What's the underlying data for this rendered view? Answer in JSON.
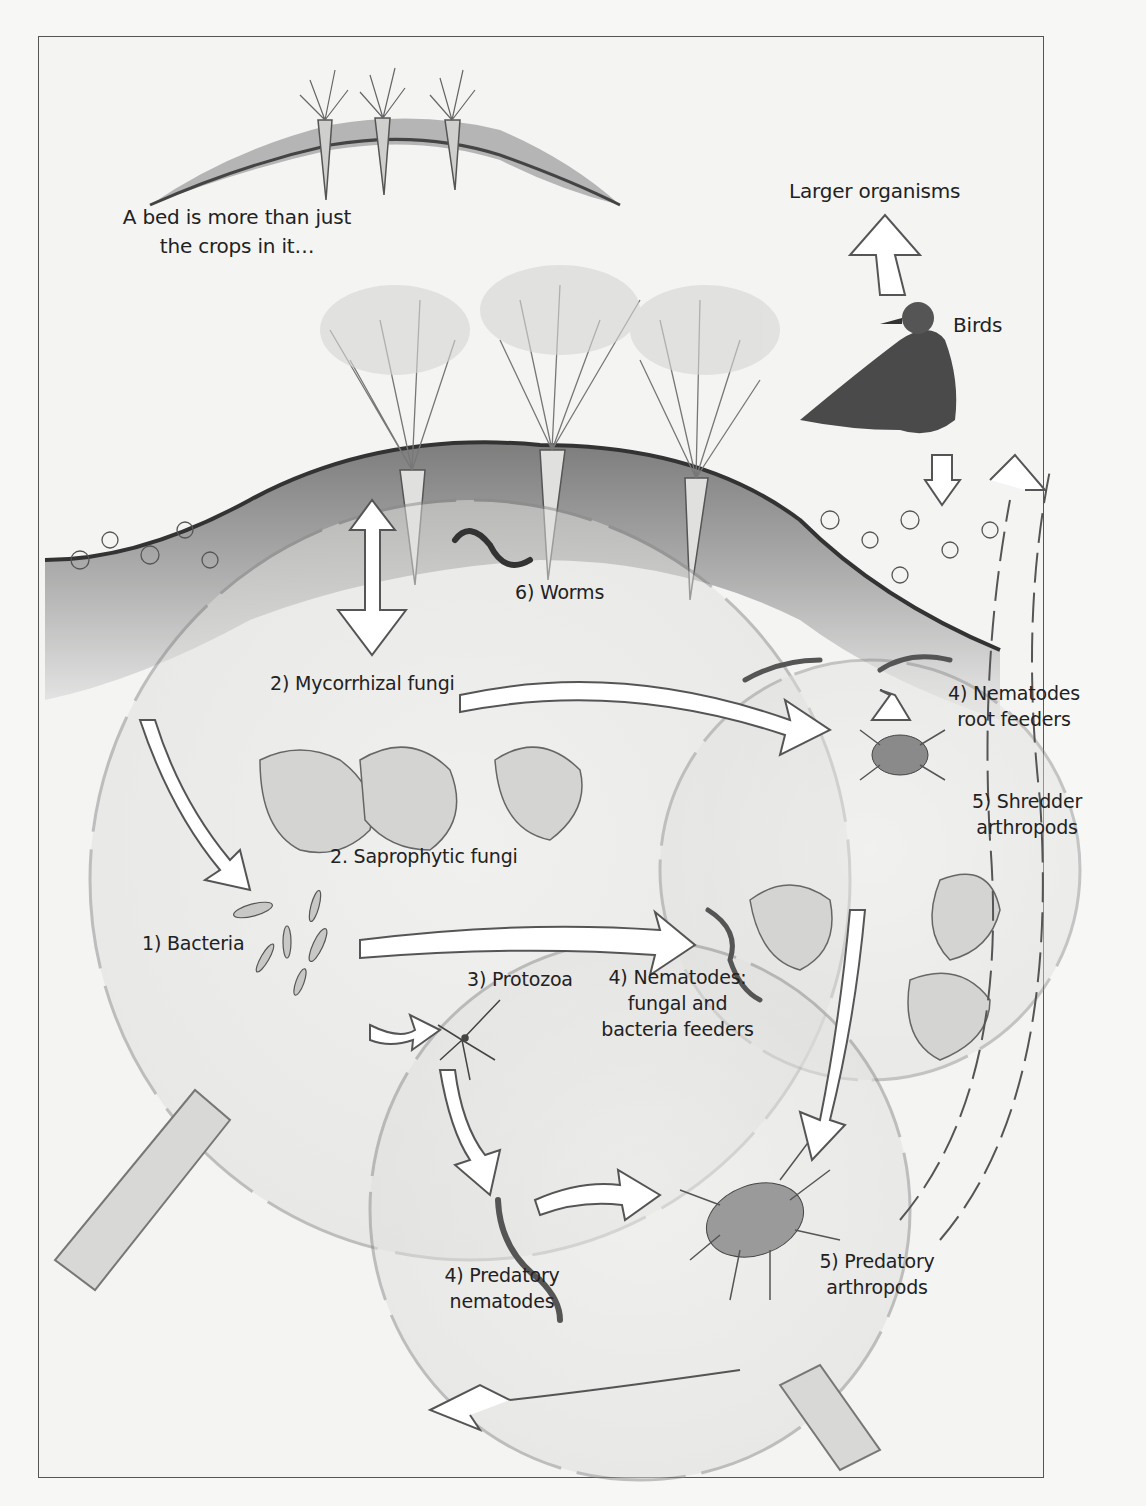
{
  "diagram": {
    "type": "soil food web illustration",
    "style": "pencil sketch, grayscale",
    "colors": {
      "background": "#f4f4f3",
      "ink": "#222222",
      "soil": "#6a6a6a",
      "arrow_fill": "#ffffff"
    }
  },
  "captions": {
    "intro_line1": "A bed is more than just",
    "intro_line2": "the crops in it…",
    "larger_organisms": "Larger organisms",
    "birds": "Birds"
  },
  "nodes": [
    {
      "id": "worms",
      "label": "6) Worms"
    },
    {
      "id": "mycorrhizal",
      "label": "2) Mycorrhizal fungi"
    },
    {
      "id": "nematodes_root",
      "label_line1": "4) Nematodes",
      "label_line2": "root feeders"
    },
    {
      "id": "shredder",
      "label_line1": "5) Shredder",
      "label_line2": "arthropods"
    },
    {
      "id": "saprophytic",
      "label": "2. Saprophytic fungi"
    },
    {
      "id": "bacteria",
      "label": "1) Bacteria"
    },
    {
      "id": "protozoa",
      "label": "3) Protozoa"
    },
    {
      "id": "nematodes_fb",
      "label_line1": "4) Nematodes:",
      "label_line2": "fungal and",
      "label_line3": "bacteria feeders"
    },
    {
      "id": "predatory_nematodes",
      "label_line1": "4) Predatory",
      "label_line2": "nematodes"
    },
    {
      "id": "predatory_arthropods",
      "label_line1": "5) Predatory",
      "label_line2": "arthropods"
    }
  ]
}
